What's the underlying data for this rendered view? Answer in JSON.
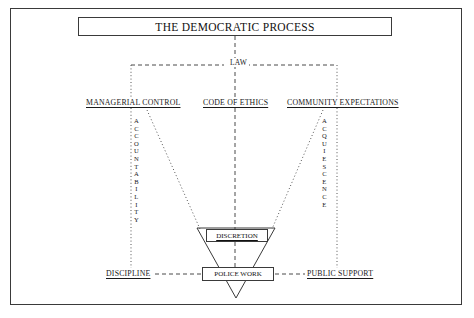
{
  "diagram": {
    "title": "THE DEMOCRATIC PROCESS",
    "law_label": "LAW",
    "tier2": {
      "managerial_control": "MANAGERIAL CONTROL",
      "code_of_ethics": "CODE OF ETHICS",
      "community_expectations": "COMMUNITY EXPECTATIONS"
    },
    "vertical_left": {
      "word": "ACCOUNTABILITY",
      "letters": [
        "A",
        "C",
        "C",
        "O",
        "U",
        "N",
        "T",
        "A",
        "B",
        "I",
        "L",
        "I",
        "T",
        "Y"
      ]
    },
    "vertical_right": {
      "word": "ACQUIESCENCE",
      "letters": [
        "A",
        "C",
        "Q",
        "U",
        "I",
        "E",
        "S",
        "C",
        "E",
        "N",
        "C",
        "E"
      ]
    },
    "funnel": {
      "discretion": "DISCRETION",
      "police_work": "POLICE WORK"
    },
    "bottom": {
      "discipline": "DISCIPLINE",
      "public_support": "PUBLIC SUPPORT"
    },
    "colors": {
      "line": "#3a3a3a",
      "text": "#1a1a1a",
      "background": "#ffffff"
    }
  }
}
